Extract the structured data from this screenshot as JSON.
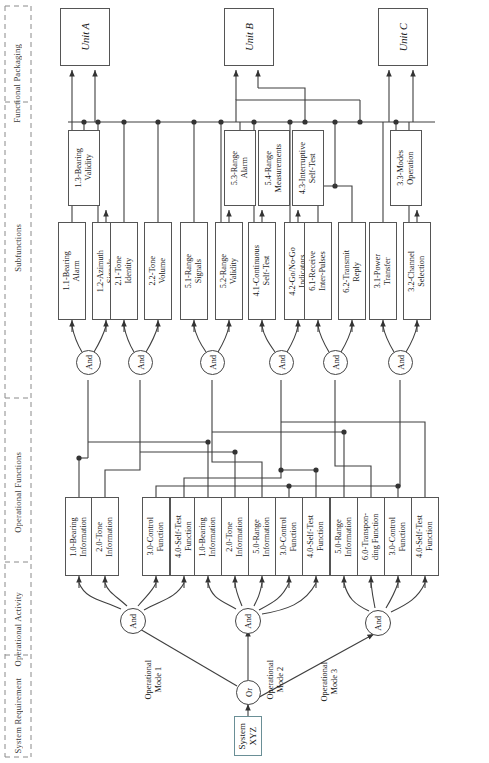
{
  "diagram": {
    "columns": [
      {
        "id": "system-requirement",
        "label": "System\nRequirement"
      },
      {
        "id": "operational-activity",
        "label": "Operational\nActivity"
      },
      {
        "id": "operational-functions",
        "label": "Operational\nFunctions"
      },
      {
        "id": "subfunctions",
        "label": "Subfunctions"
      },
      {
        "id": "functional-packaging",
        "label": "Functional Packaging"
      }
    ],
    "system_requirement": {
      "id": "system-xyz",
      "label": "System\nXYZ"
    },
    "or_gate": {
      "id": "or-gate",
      "label": "Or"
    },
    "mode_labels": [
      {
        "id": "operational-mode-1",
        "label": "Operational\nMode 1"
      },
      {
        "id": "operational-mode-2",
        "label": "Operational\nMode 2"
      },
      {
        "id": "operational-mode-3",
        "label": "Operational\nMode 3"
      }
    ],
    "activity_gates": [
      {
        "id": "and-gate-mode-1",
        "label": "And"
      },
      {
        "id": "and-gate-mode-2",
        "label": "And"
      },
      {
        "id": "and-gate-mode-3",
        "label": "And"
      }
    ],
    "operational_functions": [
      {
        "id": "of-1",
        "label": "1.0-Bearing\nInformation"
      },
      {
        "id": "of-2",
        "label": "2.0-Tone\nInformation"
      },
      {
        "id": "of-3",
        "label": "3.0-Control\nFunction"
      },
      {
        "id": "of-4",
        "label": "4.0-Self-Test\nFunction"
      },
      {
        "id": "of-5",
        "label": "1.0-Bearing\nInformation"
      },
      {
        "id": "of-6",
        "label": "2.0-Tone\nInformation"
      },
      {
        "id": "of-7",
        "label": "5.0-Range\nInformation"
      },
      {
        "id": "of-8",
        "label": "3.0-Control\nFunction"
      },
      {
        "id": "of-9",
        "label": "4.0-Self-Test\nFunction"
      },
      {
        "id": "of-10",
        "label": "5.0-Range\nInformation"
      },
      {
        "id": "of-11",
        "label": "6.0-Transpon-\nding Function"
      },
      {
        "id": "of-12",
        "label": "3.0-Control\nFunction"
      },
      {
        "id": "of-13",
        "label": "4.0-Self-Test\nFunction"
      }
    ],
    "subfunction_gates": [
      {
        "id": "and-gate-sf-1",
        "label": "And"
      },
      {
        "id": "and-gate-sf-2",
        "label": "And"
      },
      {
        "id": "and-gate-sf-3",
        "label": "And"
      },
      {
        "id": "and-gate-sf-4",
        "label": "And"
      },
      {
        "id": "and-gate-sf-5",
        "label": "And"
      },
      {
        "id": "and-gate-sf-6",
        "label": "And"
      }
    ],
    "subfunctions_lower": [
      {
        "id": "sf-1-1",
        "label": "1.1-Bearing\nAlarm"
      },
      {
        "id": "sf-1-2",
        "label": "1.2-Azimuth\nSignals"
      },
      {
        "id": "sf-2-1",
        "label": "2.1-Tone\nIdentity"
      },
      {
        "id": "sf-2-2",
        "label": "2.2-Tone\nVolume"
      },
      {
        "id": "sf-5-1",
        "label": "5.1-Range\nSignals"
      },
      {
        "id": "sf-5-2",
        "label": "5.2-Range\nValidity"
      },
      {
        "id": "sf-4-1",
        "label": "4.1-Continuous\nSelf-Test"
      },
      {
        "id": "sf-4-2",
        "label": "4.2-Go/No-Go\nIndicators"
      },
      {
        "id": "sf-6-1",
        "label": "6.1-Receive\nInter-Pulses"
      },
      {
        "id": "sf-6-2",
        "label": "6.2-Transmit\nReply"
      },
      {
        "id": "sf-3-1",
        "label": "3.1-Power\nTransfer"
      },
      {
        "id": "sf-3-2",
        "label": "3.2-Channel\nSelection"
      }
    ],
    "subfunctions_upper": [
      {
        "id": "sf-1-3",
        "label": "1.3-Bearing\nValidity"
      },
      {
        "id": "sf-5-3",
        "label": "5.3-Range\nAlarm"
      },
      {
        "id": "sf-5-4",
        "label": "5.4-Range\nMeasurements"
      },
      {
        "id": "sf-4-3",
        "label": "4.3-Interruptive\nSelf-Test"
      },
      {
        "id": "sf-3-3",
        "label": "3.3-Modes\nOperation"
      }
    ],
    "units": [
      {
        "id": "unit-a",
        "label": "Unit A"
      },
      {
        "id": "unit-b",
        "label": "Unit B"
      },
      {
        "id": "unit-c",
        "label": "Unit C"
      }
    ],
    "colors": {
      "line": "#444444",
      "box_border": "#555555",
      "header_text": "#3a3a3a",
      "divider": "#8a8a8a",
      "sysbox_border": "#6a8f96"
    }
  }
}
